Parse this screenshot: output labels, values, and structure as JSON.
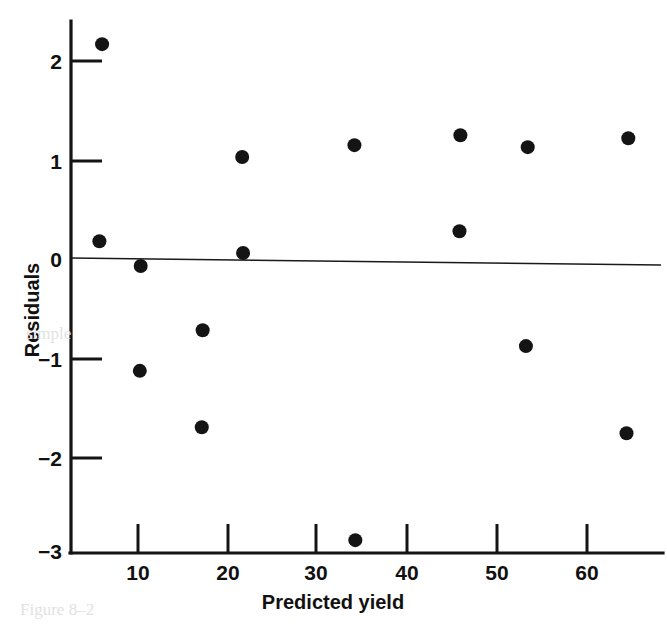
{
  "figure": {
    "type": "residual-plot",
    "background_color": "#ffffff",
    "ink_color": "#141414"
  },
  "chart_data": {
    "type": "scatter",
    "title": "",
    "subtitle": "",
    "xlabel": "Predicted yield",
    "ylabel": "Residuals",
    "xlim": [
      4.0,
      69.5
    ],
    "ylim": [
      -3.0,
      2.4
    ],
    "grid": false,
    "legend": null,
    "xticks": [
      10,
      20,
      30,
      40,
      50,
      60
    ],
    "xtick_labels": [
      "10",
      "20",
      "30",
      "40",
      "50",
      "60"
    ],
    "yticks": [
      2,
      1,
      0,
      -1,
      -2,
      -3
    ],
    "ytick_labels": [
      "2",
      "1",
      "0",
      "−1",
      "−2",
      "−3"
    ],
    "reference_line": {
      "name": "zero-residual-line",
      "y": 0,
      "style": "solid",
      "color": "#1a1a1a"
    },
    "marker": {
      "shape": "circle",
      "filled": true,
      "color": "#141414",
      "radius_px": 7
    },
    "points": [
      {
        "x": 6.0,
        "y": 2.17
      },
      {
        "x": 5.7,
        "y": 0.18
      },
      {
        "x": 10.3,
        "y": -0.07
      },
      {
        "x": 10.2,
        "y": -1.13
      },
      {
        "x": 17.2,
        "y": -0.72
      },
      {
        "x": 17.1,
        "y": -1.7
      },
      {
        "x": 21.6,
        "y": 1.03
      },
      {
        "x": 21.7,
        "y": 0.06
      },
      {
        "x": 34.1,
        "y": 1.15
      },
      {
        "x": 34.2,
        "y": -2.84
      },
      {
        "x": 45.9,
        "y": 1.25
      },
      {
        "x": 45.8,
        "y": 0.28
      },
      {
        "x": 53.4,
        "y": 1.13
      },
      {
        "x": 53.2,
        "y": -0.88
      },
      {
        "x": 64.6,
        "y": 1.22
      },
      {
        "x": 64.4,
        "y": -1.76
      }
    ]
  },
  "bleed_artifacts": [
    {
      "text": "Figure 8–2",
      "left": 20,
      "top": 600
    },
    {
      "text": "simple",
      "left": 26,
      "top": 324
    }
  ]
}
